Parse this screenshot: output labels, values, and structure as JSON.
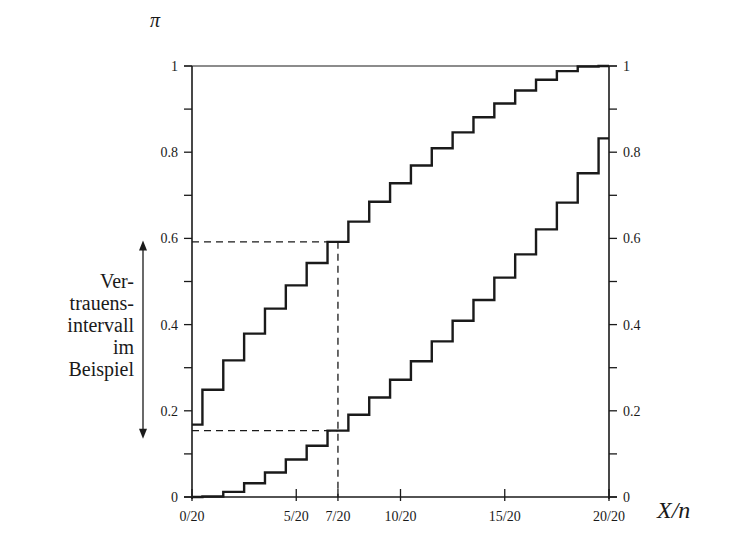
{
  "chart_data": {
    "type": "line",
    "title": "",
    "xlabel": "X/n",
    "ylabel": "π",
    "xlim": [
      0,
      1
    ],
    "ylim": [
      0,
      1
    ],
    "grid": false,
    "x_tick_labels": [
      "0/20",
      "5/20",
      "7/20",
      "10/20",
      "15/20",
      "20/20"
    ],
    "x_ticks": [
      0,
      0.25,
      0.35,
      0.5,
      0.75,
      1.0
    ],
    "y_tick_labels": [
      "0",
      "0.2",
      "0.4",
      "0.6",
      "0.8",
      "1"
    ],
    "y_ticks": [
      0,
      0.2,
      0.4,
      0.6,
      0.8,
      1.0
    ],
    "y_minor_ticks": [
      0.1,
      0.3,
      0.5,
      0.7,
      0.9
    ],
    "n": 20,
    "step_style": "steps centered between integer X values",
    "x": [
      0,
      1,
      2,
      3,
      4,
      5,
      6,
      7,
      8,
      9,
      10,
      11,
      12,
      13,
      14,
      15,
      16,
      17,
      18,
      19,
      20
    ],
    "series": [
      {
        "name": "upper confidence bound",
        "values": [
          0.168,
          0.249,
          0.317,
          0.379,
          0.437,
          0.491,
          0.543,
          0.592,
          0.639,
          0.685,
          0.728,
          0.769,
          0.809,
          0.846,
          0.881,
          0.913,
          0.943,
          0.968,
          0.988,
          0.999,
          1.0
        ]
      },
      {
        "name": "lower confidence bound",
        "values": [
          0.0,
          0.001,
          0.012,
          0.032,
          0.057,
          0.087,
          0.119,
          0.154,
          0.191,
          0.231,
          0.272,
          0.315,
          0.361,
          0.409,
          0.457,
          0.509,
          0.563,
          0.621,
          0.683,
          0.751,
          0.832
        ]
      }
    ],
    "annotations": [
      {
        "type": "dashed-lines",
        "x": 0.35,
        "y_upper": 0.592,
        "y_lower": 0.154,
        "description": "example observation X=7, n=20"
      },
      {
        "type": "double-arrow",
        "from": 0.154,
        "to": 0.592,
        "label": "Vertrauensintervall im Beispiel"
      }
    ]
  },
  "labels": {
    "y_axis": "π",
    "x_axis": "X/n",
    "note_lines": [
      "Ver-",
      "trauens-",
      "intervall",
      "im",
      "Beispiel"
    ]
  },
  "colors": {
    "line": "#1a1a1a",
    "background": "#ffffff"
  }
}
